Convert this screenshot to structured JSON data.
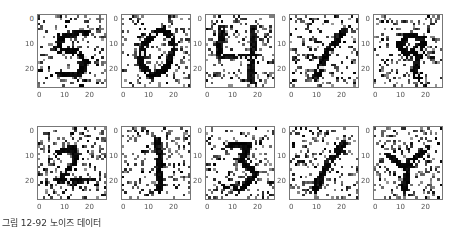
{
  "caption": "그림 12-92  노이즈 데이터",
  "chart_data": {
    "type": "heatmap",
    "layout": {
      "rows": 2,
      "cols": 5
    },
    "image_size": [
      28,
      28
    ],
    "colormap": "gray_r",
    "xticks": [
      "0",
      "10",
      "20"
    ],
    "yticks": [
      "0",
      "10",
      "20"
    ],
    "panels": [
      {
        "row": 0,
        "col": 0,
        "digit": "5"
      },
      {
        "row": 0,
        "col": 1,
        "digit": "0"
      },
      {
        "row": 0,
        "col": 2,
        "digit": "4"
      },
      {
        "row": 0,
        "col": 3,
        "digit": "1"
      },
      {
        "row": 0,
        "col": 4,
        "digit": "9"
      },
      {
        "row": 1,
        "col": 0,
        "digit": "2"
      },
      {
        "row": 1,
        "col": 1,
        "digit": "1"
      },
      {
        "row": 1,
        "col": 2,
        "digit": "3"
      },
      {
        "row": 1,
        "col": 3,
        "digit": "1"
      },
      {
        "row": 1,
        "col": 4,
        "digit": "4"
      }
    ]
  }
}
